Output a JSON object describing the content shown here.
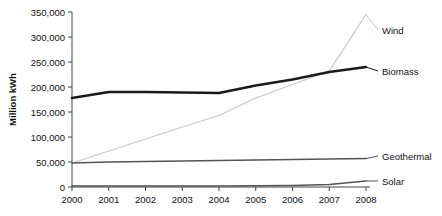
{
  "chart_data": {
    "type": "line",
    "title": "",
    "xlabel": "",
    "ylabel": "Million kWh",
    "categories": [
      "2000",
      "2001",
      "2002",
      "2003",
      "2004",
      "2005",
      "2006",
      "2007",
      "2008"
    ],
    "x": [
      2000,
      2001,
      2002,
      2003,
      2004,
      2005,
      2006,
      2007,
      2008
    ],
    "ylim": [
      0,
      350000
    ],
    "xlim": [
      2000,
      2008
    ],
    "yticks": [
      0,
      50000,
      100000,
      150000,
      200000,
      250000,
      300000,
      350000
    ],
    "ytick_labels": [
      "0",
      "50,000",
      "100,000",
      "150,000",
      "200,000",
      "250,000",
      "300,000",
      "350,000"
    ],
    "grid": false,
    "legend_position": "right-inline-labels",
    "series": [
      {
        "name": "Wind",
        "color": "#c8c8c8",
        "label": "Wind",
        "values": [
          48000,
          72000,
          96000,
          120000,
          143000,
          178000,
          205000,
          232000,
          345000
        ]
      },
      {
        "name": "Biomass",
        "color": "#1a1a1a",
        "label": "Biomass",
        "values": [
          178000,
          190000,
          190000,
          189000,
          188000,
          203000,
          215000,
          230000,
          240000
        ]
      },
      {
        "name": "Geothermal",
        "color": "#555555",
        "label": "Geothermal",
        "values": [
          48000,
          50000,
          51000,
          52000,
          53000,
          54000,
          55000,
          56000,
          57000
        ]
      },
      {
        "name": "Solar",
        "color": "#555555",
        "label": "Solar",
        "values": [
          2000,
          2000,
          2000,
          2000,
          2000,
          2500,
          3000,
          5000,
          12000
        ]
      }
    ]
  }
}
